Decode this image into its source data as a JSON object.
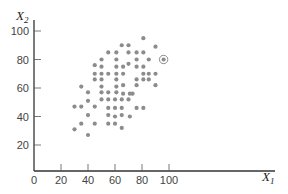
{
  "chart_data": {
    "type": "scatter",
    "title": "",
    "xlabel": "X1",
    "ylabel": "X2",
    "xlabel_main": "X",
    "xlabel_sub": "1",
    "ylabel_main": "X",
    "ylabel_sub": "2",
    "xlim": [
      0,
      180
    ],
    "ylim": [
      0,
      105
    ],
    "x_ticks": [
      0,
      20,
      40,
      60,
      80,
      100
    ],
    "y_ticks": [
      20,
      40,
      60,
      80,
      100
    ],
    "grid": false,
    "legend": null,
    "point_color": "#8c8c8c",
    "axis_color": "#333333",
    "highlighted_point": {
      "x": 96,
      "y": 80,
      "annotation": "circled outlier"
    },
    "points": [
      {
        "x": 81,
        "y": 95
      },
      {
        "x": 65,
        "y": 90
      },
      {
        "x": 70,
        "y": 90
      },
      {
        "x": 90,
        "y": 89
      },
      {
        "x": 55,
        "y": 85
      },
      {
        "x": 61,
        "y": 85
      },
      {
        "x": 70,
        "y": 85
      },
      {
        "x": 76,
        "y": 85
      },
      {
        "x": 81,
        "y": 85
      },
      {
        "x": 50,
        "y": 80
      },
      {
        "x": 61,
        "y": 80
      },
      {
        "x": 76,
        "y": 80
      },
      {
        "x": 85,
        "y": 80
      },
      {
        "x": 45,
        "y": 76
      },
      {
        "x": 50,
        "y": 75
      },
      {
        "x": 61,
        "y": 75
      },
      {
        "x": 66,
        "y": 75
      },
      {
        "x": 70,
        "y": 77
      },
      {
        "x": 76,
        "y": 75
      },
      {
        "x": 81,
        "y": 75
      },
      {
        "x": 45,
        "y": 70
      },
      {
        "x": 50,
        "y": 70
      },
      {
        "x": 55,
        "y": 70
      },
      {
        "x": 61,
        "y": 70
      },
      {
        "x": 66,
        "y": 70
      },
      {
        "x": 81,
        "y": 70
      },
      {
        "x": 85,
        "y": 70
      },
      {
        "x": 90,
        "y": 70
      },
      {
        "x": 45,
        "y": 66
      },
      {
        "x": 50,
        "y": 66
      },
      {
        "x": 61,
        "y": 66
      },
      {
        "x": 76,
        "y": 66
      },
      {
        "x": 81,
        "y": 66
      },
      {
        "x": 85,
        "y": 66
      },
      {
        "x": 35,
        "y": 61
      },
      {
        "x": 50,
        "y": 61
      },
      {
        "x": 61,
        "y": 61
      },
      {
        "x": 66,
        "y": 62
      },
      {
        "x": 76,
        "y": 62
      },
      {
        "x": 90,
        "y": 62
      },
      {
        "x": 40,
        "y": 57
      },
      {
        "x": 50,
        "y": 57
      },
      {
        "x": 55,
        "y": 57
      },
      {
        "x": 61,
        "y": 57
      },
      {
        "x": 66,
        "y": 56
      },
      {
        "x": 71,
        "y": 56
      },
      {
        "x": 73,
        "y": 56
      },
      {
        "x": 40,
        "y": 51
      },
      {
        "x": 50,
        "y": 52
      },
      {
        "x": 55,
        "y": 52
      },
      {
        "x": 60,
        "y": 52
      },
      {
        "x": 65,
        "y": 52
      },
      {
        "x": 70,
        "y": 52
      },
      {
        "x": 30,
        "y": 47
      },
      {
        "x": 35,
        "y": 47
      },
      {
        "x": 45,
        "y": 47
      },
      {
        "x": 55,
        "y": 46
      },
      {
        "x": 60,
        "y": 46
      },
      {
        "x": 65,
        "y": 46
      },
      {
        "x": 76,
        "y": 46
      },
      {
        "x": 81,
        "y": 46
      },
      {
        "x": 40,
        "y": 41
      },
      {
        "x": 55,
        "y": 41
      },
      {
        "x": 60,
        "y": 40
      },
      {
        "x": 65,
        "y": 41
      },
      {
        "x": 71,
        "y": 40
      },
      {
        "x": 35,
        "y": 35
      },
      {
        "x": 45,
        "y": 35
      },
      {
        "x": 55,
        "y": 35
      },
      {
        "x": 60,
        "y": 35
      },
      {
        "x": 30,
        "y": 31
      },
      {
        "x": 65,
        "y": 32
      },
      {
        "x": 40,
        "y": 27
      }
    ]
  },
  "axes": {
    "x_tick_labels": [
      "0",
      "20",
      "40",
      "60",
      "80",
      "100"
    ],
    "y_tick_labels": [
      "20",
      "40",
      "60",
      "80",
      "100"
    ],
    "x_title": "X",
    "x_title_sub": "1",
    "y_title": "X",
    "y_title_sub": "2"
  }
}
